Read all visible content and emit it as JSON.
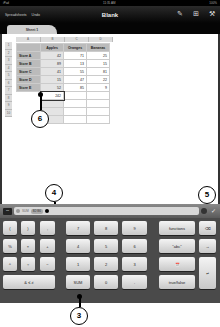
{
  "statusbar": {
    "carrier": "iPad",
    "time": "11:35 AM",
    "battery": "100%"
  },
  "toolbar": {
    "spreadsheets_link": "Spreadsheets",
    "undo_link": "Undo",
    "title": "Blank",
    "icons": [
      "wrench-icon",
      "add-icon",
      "tools-icon"
    ]
  },
  "tabs": [
    {
      "label": "Sheet 1"
    }
  ],
  "sheet": {
    "column_headers": [
      "A",
      "B",
      "C",
      "D"
    ],
    "row_headers": [
      "1",
      "2",
      "3",
      "4",
      "5",
      "6",
      "7",
      "8",
      "9",
      "10"
    ],
    "table_headers": [
      "",
      "Apples",
      "Oranges",
      "Bananas"
    ],
    "rows": [
      {
        "label": "Store A",
        "values": [
          "42",
          "71",
          "25"
        ]
      },
      {
        "label": "Store B",
        "values": [
          "89",
          "13",
          "15"
        ]
      },
      {
        "label": "Store C",
        "values": [
          "41",
          "55",
          "81"
        ]
      },
      {
        "label": "Store D",
        "values": [
          "15",
          "47",
          "22"
        ]
      },
      {
        "label": "Store E",
        "values": [
          "52",
          "85",
          "9"
        ]
      }
    ],
    "selected_cell_value": "242"
  },
  "callouts": {
    "c3": "3",
    "c4": "4",
    "c5": "5",
    "c6": "6"
  },
  "formula_bar": {
    "menu_label": "•••",
    "function_token": "SUM",
    "range_token": "B2:B6"
  },
  "keyboard": {
    "keys": {
      "lparen": "(",
      "rparen": ")",
      "comma": ",",
      "percent": "%",
      "times": "×",
      "plus": "+",
      "caret": "^",
      "divide": "÷",
      "minus": "−",
      "logic": "& ≤ ≠",
      "k7": "7",
      "k8": "8",
      "k9": "9",
      "k4": "4",
      "k5": "5",
      "k6": "6",
      "k1": "1",
      "k2": "2",
      "k3": "3",
      "sum": "SUM",
      "k0": "0",
      "dot": ".",
      "functions": "functions",
      "text": "\"abc\"",
      "date": "📅",
      "truefalse": "true/false",
      "delete": "⌫",
      "next": "→",
      "return": "↵"
    }
  }
}
